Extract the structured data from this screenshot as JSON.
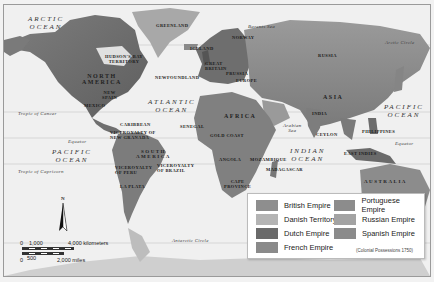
{
  "map": {
    "title_hidden": "",
    "colors": {
      "background": "#f0f0f0",
      "land_base": "#8a8a8a",
      "land_light": "#b5b5b5",
      "land_dark": "#5a5a5a",
      "ice": "#d8d8d8",
      "border": "#9a9a9a"
    },
    "oceans": {
      "arctic": "ARCTIC\nOCEAN",
      "atlantic": "ATLANTIC\nOCEAN",
      "pacific_west": "PACIFIC\nOCEAN",
      "pacific_east": "PACIFIC\nOCEAN",
      "indian": "INDIAN\nOCEAN"
    },
    "seas": {
      "barents": "Barents Sea",
      "arabian": "Arabian\nSea"
    },
    "lines": {
      "arctic_circle": "Arctic Circle",
      "tropic_cancer": "Tropic of Cancer",
      "equator_west": "Equator",
      "equator_east": "Equator",
      "tropic_capricorn": "Tropic of Capricorn",
      "antarctic_circle": "Antarctic Circle"
    },
    "continents": {
      "north_america": "NORTH\nAMERICA",
      "south_america": "SOUTH\nAMERICA",
      "africa": "AFRICA",
      "asia": "ASIA",
      "australia": "AUSTRALIA"
    },
    "regions": {
      "greenland": "GREENLAND",
      "hudson_bay": "HUDSON'S BAY\nTERRITORY",
      "new_spain": "NEW\nSPAIN",
      "mexico": "MEXICO",
      "newfoundland": "NEWFOUNDLAND",
      "iceland": "ICELAND",
      "norway": "NORWAY",
      "great_britain": "GREAT\nBRITAIN",
      "prussia": "PRUSSIA",
      "europe": "EUROPE",
      "russia": "RUSSIA",
      "caribbean": "CARIBBEAN",
      "vicer_new_granada": "VICEROYALTY OF\nNEW GRANADA",
      "vicer_peru": "VICEROYALTY\nOF PERU",
      "vicer_brazil": "VICEROYALTY\nOF BRAZIL",
      "la_plata": "LA PLATA",
      "senegal": "SENEGAL",
      "gold_coast": "GOLD COAST",
      "angola": "ANGOLA",
      "mozambique": "MOZAMBIQUE",
      "madagascar": "MADAGASCAR",
      "cape_province": "CAPE\nPROVINCE",
      "india": "INDIA",
      "ceylon": "CEYLON",
      "philippines": "PHILIPPINES",
      "east_indies": "EAST INDIES"
    },
    "compass": {
      "north_label": "N"
    },
    "scale_bar": {
      "km_start": "0",
      "km_mid": "1,000",
      "km_end": "4,000 kilometers",
      "mi_start": "0",
      "mi_mid": "500",
      "mi_end": "2,000 miles"
    }
  },
  "legend": {
    "items": [
      {
        "label": "British Empire",
        "color": "#8e8e8e"
      },
      {
        "label": "Danish Territory",
        "color": "#b4b4b4"
      },
      {
        "label": "Dutch Empire",
        "color": "#6a6a6a"
      },
      {
        "label": "French Empire",
        "color": "#8a8a8a"
      },
      {
        "label": "Portuguese Empire",
        "color": "#8c8c8c"
      },
      {
        "label": "Russian Empire",
        "color": "#a3a3a3"
      },
      {
        "label": "Spanish Empire",
        "color": "#8b8b8b"
      }
    ],
    "note": "(Colonial Possessions 1750)"
  }
}
